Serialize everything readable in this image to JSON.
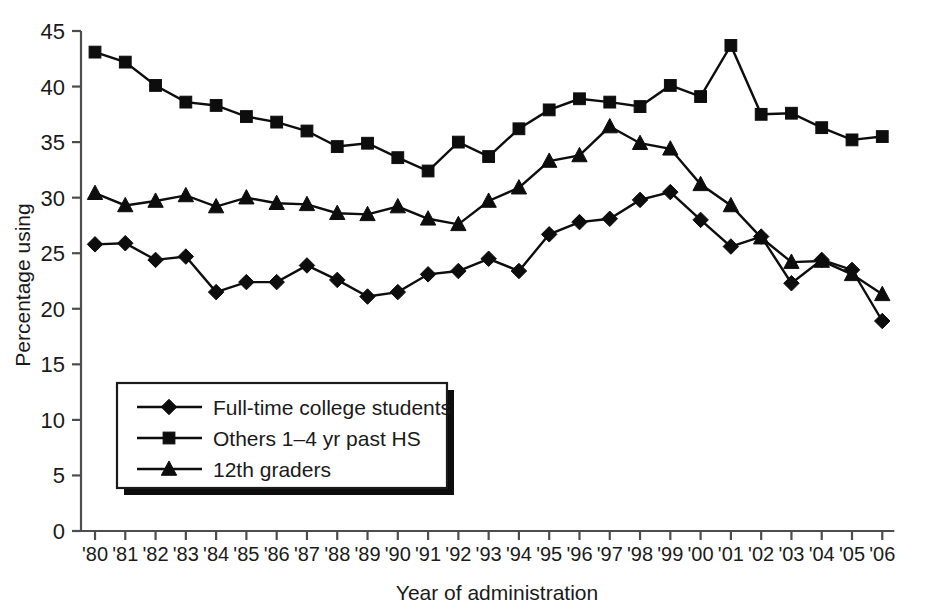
{
  "chart_data": {
    "type": "line",
    "title": "",
    "xlabel": "Year of administration",
    "ylabel": "Percentage using",
    "ylim": [
      0,
      45
    ],
    "yticks": [
      0,
      5,
      10,
      15,
      20,
      25,
      30,
      35,
      40,
      45
    ],
    "ytick_labels": [
      "0",
      "5",
      "10",
      "15",
      "20",
      "25",
      "30",
      "35",
      "40",
      "45"
    ],
    "x": [
      1980,
      1981,
      1982,
      1983,
      1984,
      1985,
      1986,
      1987,
      1988,
      1989,
      1990,
      1991,
      1992,
      1993,
      1994,
      1995,
      1996,
      1997,
      1998,
      1999,
      2000,
      2001,
      2002,
      2003,
      2004,
      2005,
      2006
    ],
    "categories": [
      "'80",
      "'81",
      "'82",
      "'83",
      "'84",
      "'85",
      "'86",
      "'87",
      "'88",
      "'89",
      "'90",
      "'91",
      "'92",
      "'93",
      "'94",
      "'95",
      "'96",
      "'97",
      "'98",
      "'99",
      "'00",
      "'01",
      "'02",
      "'03",
      "'04",
      "'05",
      "'06"
    ],
    "grid": false,
    "legend_position": "lower-left",
    "series": [
      {
        "name": "Full-time college students",
        "marker": "diamond",
        "values": [
          25.8,
          25.9,
          24.4,
          24.7,
          21.5,
          22.4,
          22.4,
          23.9,
          22.6,
          21.1,
          21.5,
          23.1,
          23.4,
          24.5,
          23.4,
          26.7,
          27.8,
          28.1,
          29.8,
          30.5,
          28.0,
          25.6,
          26.5,
          22.3,
          24.4,
          23.5,
          18.9
        ]
      },
      {
        "name": "Others 1–4 yr past HS",
        "marker": "square",
        "values": [
          43.1,
          42.2,
          40.1,
          38.6,
          38.3,
          37.3,
          36.8,
          36.0,
          34.6,
          34.9,
          33.6,
          32.4,
          35.0,
          33.7,
          36.2,
          37.9,
          38.9,
          38.6,
          38.2,
          40.1,
          39.1,
          43.7,
          37.5,
          37.6,
          36.3,
          35.2,
          35.5
        ]
      },
      {
        "name": "12th graders",
        "marker": "triangle",
        "values": [
          30.4,
          29.3,
          29.7,
          30.2,
          29.2,
          30.0,
          29.5,
          29.4,
          28.6,
          28.5,
          29.2,
          28.1,
          27.6,
          29.7,
          30.9,
          33.3,
          33.8,
          36.4,
          34.9,
          34.4,
          31.2,
          29.3,
          26.4,
          24.2,
          24.3,
          23.1,
          21.3
        ]
      }
    ],
    "legend_entries": [
      {
        "label": "Full-time college students",
        "marker": "diamond"
      },
      {
        "label": "Others 1–4 yr past HS",
        "marker": "square"
      },
      {
        "label": "12th graders",
        "marker": "triangle"
      }
    ]
  }
}
